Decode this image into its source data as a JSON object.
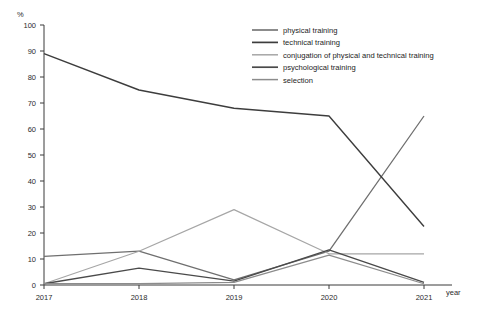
{
  "chart_data": {
    "type": "line",
    "title": "",
    "xlabel": "year",
    "ylabel": "%",
    "categories": [
      "2017",
      "2018",
      "2019",
      "2020",
      "2021"
    ],
    "x": [
      2017,
      2018,
      2019,
      2020,
      2021
    ],
    "ylim": [
      0,
      100
    ],
    "yticks": [
      0,
      10,
      20,
      30,
      40,
      50,
      60,
      70,
      80,
      90,
      100
    ],
    "grid": false,
    "legend_position": "top-right",
    "series": [
      {
        "name": "physical training",
        "color": "#6f6f6f",
        "width": 1.3,
        "values": [
          11,
          13,
          2,
          13,
          65
        ]
      },
      {
        "name": "technical training",
        "color": "#3d3d3d",
        "width": 1.4,
        "values": [
          89,
          75,
          68,
          65,
          22.5
        ]
      },
      {
        "name": "conjugation of physical and technical training",
        "color": "#a6a6a6",
        "width": 1.2,
        "values": [
          0.5,
          13,
          29,
          12,
          12
        ]
      },
      {
        "name": "psychological training",
        "color": "#4a4a4a",
        "width": 1.4,
        "values": [
          0.5,
          6.5,
          1.5,
          13.5,
          1
        ]
      },
      {
        "name": "selection",
        "color": "#8c8c8c",
        "width": 1.2,
        "values": [
          0.5,
          0.5,
          1,
          11.5,
          0.5
        ]
      }
    ]
  },
  "axes": {
    "y_unit_label": "%",
    "x_axis_label": "year",
    "y_tick_labels": [
      "100",
      "90",
      "80",
      "70",
      "60",
      "50",
      "40",
      "30",
      "20",
      "10",
      "0"
    ],
    "x_tick_labels": [
      "2017",
      "2018",
      "2019",
      "2020",
      "2021"
    ]
  },
  "legend": {
    "items": [
      {
        "label": "physical training"
      },
      {
        "label": "technical training"
      },
      {
        "label": "conjugation of physical and technical training"
      },
      {
        "label": "psychological training"
      },
      {
        "label": "selection"
      }
    ]
  }
}
